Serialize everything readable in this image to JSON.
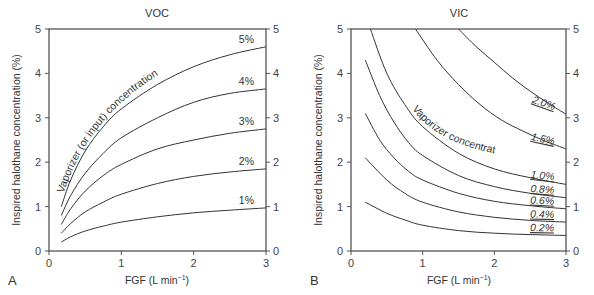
{
  "chart_data": [
    {
      "type": "line",
      "panel": "A",
      "title": "VOC",
      "xlabel": "FGF (L min⁻¹)",
      "ylabel": "Inspired halothane concentration (%)",
      "xlim": [
        0,
        3
      ],
      "ylim": [
        0,
        5
      ],
      "xticks": [
        "0",
        "1",
        "2",
        "3"
      ],
      "yticks": [
        "0",
        "1",
        "2",
        "3",
        "4",
        "5"
      ],
      "grid": false,
      "annotation": "Vaporizer (or input) concentration",
      "series": [
        {
          "name": "5%",
          "x": [
            0.17,
            0.3,
            0.5,
            0.75,
            1.0,
            1.5,
            2.0,
            2.5,
            3.0
          ],
          "values": [
            1.0,
            1.6,
            2.25,
            2.8,
            3.2,
            3.75,
            4.15,
            4.42,
            4.6
          ]
        },
        {
          "name": "4%",
          "x": [
            0.17,
            0.3,
            0.5,
            0.75,
            1.0,
            1.5,
            2.0,
            2.5,
            3.0
          ],
          "values": [
            0.8,
            1.25,
            1.75,
            2.2,
            2.55,
            3.0,
            3.35,
            3.55,
            3.65
          ]
        },
        {
          "name": "3%",
          "x": [
            0.17,
            0.3,
            0.5,
            0.75,
            1.0,
            1.5,
            2.0,
            2.5,
            3.0
          ],
          "values": [
            0.6,
            0.95,
            1.35,
            1.7,
            1.95,
            2.3,
            2.5,
            2.65,
            2.75
          ]
        },
        {
          "name": "2%",
          "x": [
            0.17,
            0.3,
            0.5,
            0.75,
            1.0,
            1.5,
            2.0,
            2.5,
            3.0
          ],
          "values": [
            0.4,
            0.62,
            0.88,
            1.1,
            1.28,
            1.52,
            1.68,
            1.78,
            1.85
          ]
        },
        {
          "name": "1%",
          "x": [
            0.17,
            0.3,
            0.5,
            0.75,
            1.0,
            1.5,
            2.0,
            2.5,
            3.0
          ],
          "values": [
            0.2,
            0.32,
            0.45,
            0.56,
            0.65,
            0.77,
            0.86,
            0.92,
            0.97
          ]
        }
      ]
    },
    {
      "type": "line",
      "panel": "B",
      "title": "VIC",
      "xlabel": "FGF (L min⁻¹)",
      "ylabel": "Inspired halothane concentration (%)",
      "xlim": [
        0,
        3
      ],
      "ylim": [
        0,
        5
      ],
      "xticks": [
        "0",
        "1",
        "2",
        "3"
      ],
      "yticks": [
        "0",
        "1",
        "2",
        "3",
        "4",
        "5"
      ],
      "grid": false,
      "annotation": "Vaporizer concentration",
      "series": [
        {
          "name": "2.0%",
          "x": [
            1.5,
            1.75,
            2.0,
            2.25,
            2.5,
            2.75,
            3.0
          ],
          "values": [
            5.0,
            4.6,
            4.25,
            3.9,
            3.6,
            3.33,
            3.08
          ]
        },
        {
          "name": "1.5%",
          "x": [
            0.9,
            1.2,
            1.5,
            1.8,
            2.1,
            2.4,
            2.7,
            3.0
          ],
          "values": [
            5.0,
            4.3,
            3.75,
            3.3,
            2.95,
            2.7,
            2.48,
            2.3
          ]
        },
        {
          "name": "1.0%",
          "x": [
            0.27,
            0.5,
            0.75,
            1.0,
            1.5,
            2.0,
            2.5,
            3.0
          ],
          "values": [
            5.0,
            4.0,
            3.3,
            2.8,
            2.2,
            1.85,
            1.65,
            1.5
          ]
        },
        {
          "name": "0.8%",
          "x": [
            0.2,
            0.4,
            0.6,
            0.8,
            1.0,
            1.5,
            2.0,
            2.5,
            3.0
          ],
          "values": [
            4.3,
            3.5,
            2.9,
            2.45,
            2.15,
            1.7,
            1.45,
            1.3,
            1.2
          ]
        },
        {
          "name": "0.6%",
          "x": [
            0.2,
            0.4,
            0.6,
            0.8,
            1.0,
            1.5,
            2.0,
            2.5,
            3.0
          ],
          "values": [
            3.1,
            2.5,
            2.1,
            1.8,
            1.6,
            1.3,
            1.12,
            1.02,
            0.95
          ]
        },
        {
          "name": "0.4%",
          "x": [
            0.2,
            0.5,
            0.75,
            1.0,
            1.5,
            2.0,
            2.5,
            3.0
          ],
          "values": [
            2.1,
            1.6,
            1.3,
            1.1,
            0.88,
            0.76,
            0.69,
            0.65
          ]
        },
        {
          "name": "0.2%",
          "x": [
            0.2,
            0.5,
            0.75,
            1.0,
            1.5,
            2.0,
            2.5,
            3.0
          ],
          "values": [
            1.1,
            0.85,
            0.7,
            0.58,
            0.46,
            0.4,
            0.37,
            0.35
          ]
        }
      ]
    }
  ],
  "panels": {
    "a": {
      "letter": "A",
      "title": "VOC",
      "xlabel": "FGF (L min",
      "xlabel_sup": "−1",
      "xlabel_end": ")",
      "ylabel": "Inspired halothane concentration (%)",
      "annotation": "Vaporizer (or input) concentration"
    },
    "b": {
      "letter": "B",
      "title": "VIC",
      "xlabel": "FGF (L min",
      "xlabel_sup": "−1",
      "xlabel_end": ")",
      "ylabel": "Inspired halothane concentration (%)",
      "annotation": "Vaporizer concentration"
    }
  }
}
